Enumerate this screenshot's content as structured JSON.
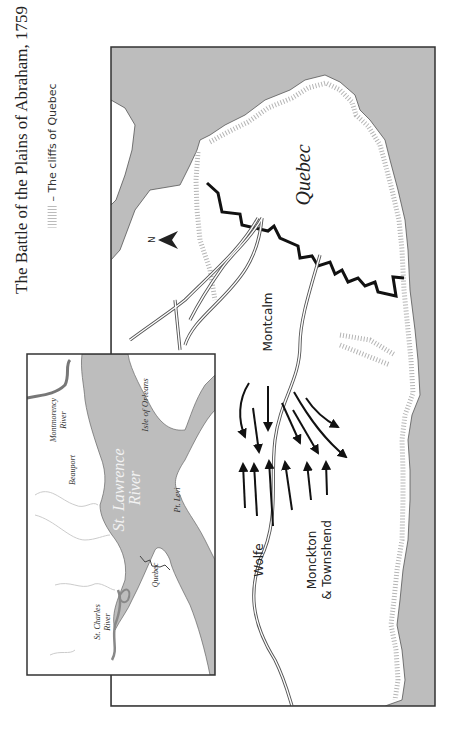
{
  "title": "The Battle of the Plains of Abraham, 1759",
  "legend": {
    "symbol": "hatched-cliff-line",
    "label": "– The cliffs of Quebec"
  },
  "main_map": {
    "labels": {
      "city": "Quebec",
      "montcalm": "Montcalm",
      "wolfe": "Wolfe",
      "monckton": "Monckton",
      "townshend": "& Townshend"
    },
    "compass": {
      "label": "N",
      "icon": "north-arrow-icon"
    }
  },
  "inset_map": {
    "labels": {
      "river_main_1": "St. Lawrence",
      "river_main_2": "River",
      "island": "Isle of Orleans",
      "montmorency_1": "Montmorency",
      "montmorency_2": "River",
      "beauport": "Beauport",
      "point_levi": "Pt. Levi",
      "quebec": "Quebec",
      "st_charles_1": "St. Charles",
      "st_charles_2": "River"
    }
  },
  "colors": {
    "water": "#bdbdbd",
    "land": "#ffffff",
    "frame": "#333333",
    "wall": "#111111",
    "cliff_hatch": "#b5b5b5"
  }
}
